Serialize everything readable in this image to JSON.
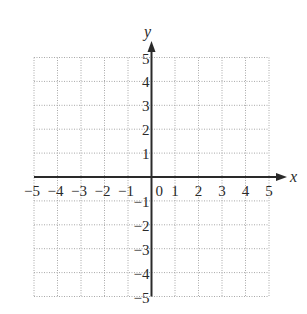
{
  "chart_data": {
    "type": "coordinate-grid",
    "title": "",
    "xlabel": "x",
    "ylabel": "y",
    "xlim": [
      -5,
      5
    ],
    "ylim": [
      -5,
      5
    ],
    "grid": true,
    "grid_style": "dotted",
    "x_ticks": [
      -5,
      -4,
      -3,
      -2,
      -1,
      0,
      1,
      2,
      3,
      4,
      5
    ],
    "y_ticks": [
      -5,
      -4,
      -3,
      -2,
      -1,
      1,
      2,
      3,
      4,
      5
    ],
    "x_tick_labels": [
      "−5",
      "−4",
      "−3",
      "−2",
      "−1",
      "0",
      "1",
      "2",
      "3",
      "4",
      "5"
    ],
    "y_tick_labels": [
      "−5",
      "−4",
      "−3",
      "−2",
      "−1",
      "1",
      "2",
      "3",
      "4",
      "5"
    ],
    "series": []
  },
  "axes": {
    "x_label": "x",
    "y_label": "y",
    "origin_label": "0"
  },
  "colors": {
    "axis": "#2a2a2a",
    "grid": "#a8a8a8",
    "text": "#2a2a2a",
    "background": "#ffffff"
  }
}
